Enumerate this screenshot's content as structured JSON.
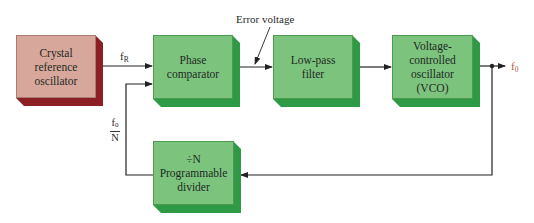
{
  "diagram": {
    "type": "phase-locked loop frequency synthesizer block diagram",
    "colors": {
      "block_face": "#7cc47e",
      "block_side": "#2e9a45",
      "reference_face": "#d7a79c",
      "reference_side": "#8c1f24",
      "wire": "#222222",
      "output_label": "#b0603e"
    },
    "blocks": {
      "crystal": {
        "lines": [
          "Crystal",
          "reference",
          "oscillator"
        ]
      },
      "phase_comparator": {
        "lines": [
          "Phase",
          "comparator"
        ]
      },
      "low_pass_filter": {
        "lines": [
          "Low-pass",
          "filter"
        ]
      },
      "vco": {
        "lines": [
          "Voltage-",
          "controlled",
          "oscillator",
          "(VCO)"
        ]
      },
      "divider": {
        "lines": [
          "÷N",
          "Programmable",
          "divider"
        ]
      }
    },
    "labels": {
      "fr_main": "f",
      "fr_sub": "R",
      "error_voltage": "Error voltage",
      "f0_main": "f",
      "f0_sub": "0",
      "feedback_num_main": "f",
      "feedback_num_sub": "0",
      "feedback_den": "N"
    },
    "connections": [
      {
        "from": "crystal",
        "to": "phase_comparator",
        "label": "fR"
      },
      {
        "from": "phase_comparator",
        "to": "low_pass_filter",
        "label": "Error voltage"
      },
      {
        "from": "low_pass_filter",
        "to": "vco"
      },
      {
        "from": "vco",
        "to": "output",
        "label": "f0"
      },
      {
        "from": "vco",
        "to": "divider"
      },
      {
        "from": "divider",
        "to": "phase_comparator",
        "label": "f0/N"
      }
    ]
  }
}
